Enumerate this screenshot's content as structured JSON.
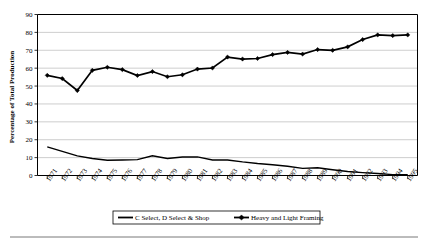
{
  "chart_data": {
    "type": "line",
    "title": "",
    "subtitle": "",
    "xlabel": "",
    "ylabel": "Percentage of Total Production",
    "ylim": [
      0,
      90
    ],
    "ytick_step": 10,
    "yticks": [
      "0",
      "10",
      "20",
      "30",
      "40",
      "50",
      "60",
      "70",
      "80",
      "90"
    ],
    "grid": true,
    "grid_axis": "y",
    "legend_position": "bottom",
    "categories": [
      "1971",
      "1972",
      "1973",
      "1974",
      "1975",
      "1976",
      "1977",
      "1978",
      "1979",
      "1980",
      "1981",
      "1982",
      "1983",
      "1984",
      "1985",
      "1986",
      "1987",
      "1988",
      "1989",
      "1990",
      "1991",
      "1992",
      "1993",
      "1994",
      "1995"
    ],
    "series": [
      {
        "name": "C Select, D Select & Shop",
        "marker": "none",
        "values": [
          16.0,
          13.5,
          11.0,
          9.5,
          8.5,
          8.7,
          8.9,
          11.0,
          9.5,
          10.3,
          10.4,
          8.7,
          8.7,
          7.6,
          6.7,
          6.0,
          5.2,
          4.0,
          4.3,
          3.2,
          2.2,
          1.6,
          1.1,
          0.5,
          0.4
        ]
      },
      {
        "name": "Heavy and Light Framing",
        "marker": "diamond",
        "values": [
          56.0,
          54.2,
          47.5,
          58.8,
          60.5,
          59.2,
          55.9,
          58.1,
          55.2,
          56.3,
          59.5,
          60.1,
          66.2,
          65.1,
          65.4,
          67.6,
          68.8,
          67.9,
          70.4,
          70.0,
          71.9,
          76.0,
          78.6,
          78.2,
          78.6
        ]
      }
    ]
  },
  "legend": {
    "items": [
      {
        "label": "C Select, D Select & Shop",
        "marker": "none"
      },
      {
        "label": "Heavy and Light Framing",
        "marker": "diamond"
      }
    ]
  }
}
